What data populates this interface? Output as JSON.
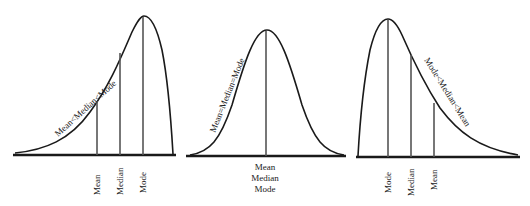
{
  "diagram": {
    "panels": [
      {
        "name": "negatively-skewed",
        "curve_label": "Mean<Median<Mode",
        "markers": [
          {
            "label": "Mean"
          },
          {
            "label": "Median"
          },
          {
            "label": "Mode"
          }
        ]
      },
      {
        "name": "symmetric",
        "curve_label": "Mean=Median=Mode",
        "center_labels": [
          "Mean",
          "Median",
          "Mode"
        ]
      },
      {
        "name": "positively-skewed",
        "curve_label": "Mode<Median<Mean",
        "markers": [
          {
            "label": "Mode"
          },
          {
            "label": "Median"
          },
          {
            "label": "Mean"
          }
        ]
      }
    ],
    "colors": {
      "curve": "#1a1a1a",
      "marker_line": "#555555",
      "text": "#222222"
    }
  }
}
